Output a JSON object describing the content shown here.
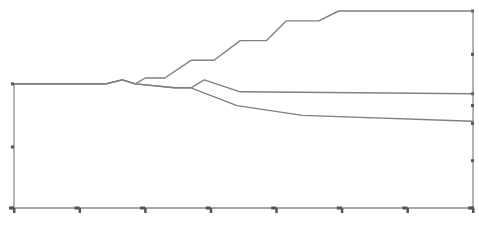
{
  "chart_data": {
    "type": "line",
    "title": "",
    "xlabel": "",
    "ylabel": "",
    "grid": false,
    "legend": "none",
    "xlim": [
      0,
      7
    ],
    "ylim": [
      0,
      10
    ],
    "x_ticks": [
      0,
      1,
      2,
      3,
      4,
      5,
      6,
      7
    ],
    "x_tick_labels": [
      "",
      "",
      "",
      "",
      "",
      "",
      "",
      ""
    ],
    "y_ticks_left": [
      0,
      3.1,
      6.3
    ],
    "y_ticks_right": [
      0,
      2.4,
      4.3,
      5.2,
      5.8,
      7.8,
      10
    ],
    "series_color": "#808080",
    "axis_color": "#8a8a8a",
    "series": [
      {
        "name": "upper-branch",
        "x": [
          0,
          1.4,
          1.65,
          1.85,
          2.0,
          2.3,
          2.7,
          3.05,
          3.45,
          3.85,
          4.15,
          4.65,
          4.95,
          5.15,
          7.0
        ],
        "y": [
          6.3,
          6.3,
          6.5,
          6.3,
          6.6,
          6.6,
          7.5,
          7.5,
          8.5,
          8.5,
          9.5,
          9.5,
          10.0,
          10.0,
          10.0
        ]
      },
      {
        "name": "middle-branch",
        "x": [
          0,
          1.4,
          1.65,
          1.85,
          2.45,
          2.7,
          2.9,
          3.45,
          7.0
        ],
        "y": [
          6.3,
          6.3,
          6.5,
          6.3,
          6.1,
          6.1,
          6.5,
          5.9,
          5.8
        ]
      },
      {
        "name": "lower-branch",
        "x": [
          0,
          1.4,
          1.65,
          1.85,
          2.45,
          2.7,
          3.4,
          4.4,
          7.0
        ],
        "y": [
          6.3,
          6.3,
          6.5,
          6.3,
          6.1,
          6.1,
          5.2,
          4.7,
          4.4
        ]
      }
    ]
  }
}
